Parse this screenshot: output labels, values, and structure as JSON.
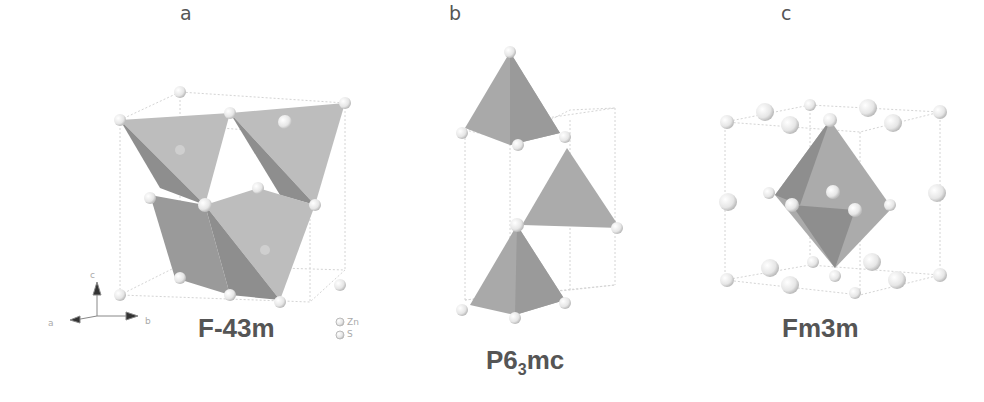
{
  "panels": [
    {
      "id": "a",
      "label": "a",
      "space_group": "F-43m",
      "structure": "zinc blende (cubic)",
      "polyhedra": "tetrahedra"
    },
    {
      "id": "b",
      "label": "b",
      "space_group_main": "P6",
      "space_group_sub": "3",
      "space_group_tail": "mc",
      "space_group": "P6₃mc",
      "structure": "wurtzite (hexagonal)",
      "polyhedra": "tetrahedra"
    },
    {
      "id": "c",
      "label": "c",
      "space_group": "Fm3m",
      "structure": "rock salt (cubic)",
      "polyhedra": "octahedron"
    }
  ],
  "legend": {
    "items": [
      {
        "label": "Zn"
      },
      {
        "label": "S"
      }
    ]
  },
  "axes": {
    "labels": [
      "c",
      "a",
      "b"
    ]
  },
  "colors": {
    "polyhedron_light": "#b9b9b9",
    "polyhedron_dark": "#8f8f8f",
    "atom": "#ececec",
    "cell_line": "#d0d0d0",
    "text": "#555555"
  }
}
